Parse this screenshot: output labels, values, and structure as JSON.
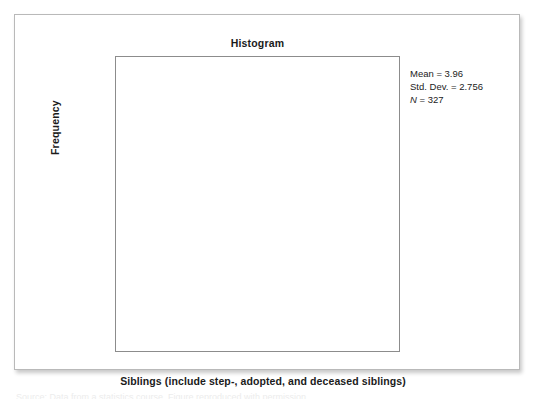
{
  "chart_data": {
    "type": "bar",
    "title": "Histogram",
    "xlabel": "Siblings (include step-, adopted, and deceased siblings)",
    "ylabel": "Frequency",
    "xlim": [
      -7.5,
      27
    ],
    "ylim": [
      0,
      63
    ],
    "grid": false,
    "bin_width": 1,
    "categories": [
      0,
      1,
      2,
      3,
      4,
      5,
      6,
      7,
      8,
      9,
      10,
      11,
      12,
      13,
      16,
      20
    ],
    "values": [
      6,
      44,
      60,
      59,
      56,
      32,
      21,
      17,
      10,
      7,
      5,
      3,
      3,
      2,
      1,
      1
    ],
    "bar_labels": [
      "6",
      "44",
      "60",
      "59",
      "56",
      "32",
      "21",
      "17",
      "10",
      "7",
      "5",
      "3",
      "3",
      "2",
      "1",
      "1"
    ],
    "xticks": [
      -5,
      0,
      5,
      10,
      15,
      20,
      25
    ],
    "xtick_labels": [
      "–5",
      "0",
      "5",
      "10",
      "15",
      "20",
      "25"
    ],
    "yticks": [
      0,
      10,
      20,
      30,
      40,
      50,
      60
    ],
    "ytick_labels": [
      "0",
      "10",
      "20",
      "30",
      "40",
      "50",
      "60"
    ],
    "annotations": {
      "mean_label": "Mean = 3.96",
      "stddev_label": "Std. Dev. = 2.756",
      "n_symbol": "N",
      "n_value": " = 327"
    },
    "colors": {
      "bar_fill": "#cacaca",
      "bar_stroke": "#7d7d7d",
      "axis": "#6f6f6f",
      "text": "#1b1b1b",
      "frame": "#8c8c8c",
      "card_border": "#b9b9b9"
    }
  },
  "caption_sliver": "Source: Data from a statistics course. Figure reproduced with permission."
}
